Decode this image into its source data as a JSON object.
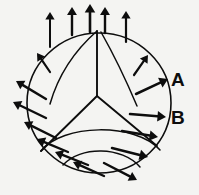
{
  "figure": {
    "background_color": "#f4f4f2",
    "ink_color": "#0d0d0d",
    "width": 199,
    "height": 195,
    "sphere": {
      "center_x": 99,
      "center_y": 103,
      "radius_x": 72,
      "radius_y": 70,
      "outline_stroke_width": 1.6
    },
    "junction": {
      "name": "y-junction",
      "center_x": 97,
      "center_y": 96,
      "branch_count": 3,
      "branch_endpoints": [
        {
          "x": 97,
          "y": 31
        },
        {
          "x": 41,
          "y": 151
        },
        {
          "x": 157,
          "y": 146
        }
      ]
    },
    "labels": [
      {
        "id": "A",
        "text": "A",
        "x": 171,
        "y": 70
      },
      {
        "id": "B",
        "text": "B",
        "x": 171,
        "y": 108
      }
    ],
    "domain_curves": [
      {
        "name": "left-meridian",
        "d": "M 97 31 C 73 52, 58 76, 50 104"
      },
      {
        "name": "right-meridian-upper",
        "d": "M 101 32 C 114 55, 126 80, 137 106"
      },
      {
        "name": "lower-lobe-large",
        "d": "M 41 151 C 62 124, 135 122, 160 150"
      },
      {
        "name": "lower-lobe-small",
        "d": "M 63 165 C 80 146, 122 146, 140 167"
      }
    ],
    "arrows": [
      {
        "id": "top-1",
        "x1": 50,
        "y1": 47,
        "x2": 50,
        "y2": 12,
        "head": 7.5,
        "width": 2.0
      },
      {
        "id": "top-2",
        "x1": 72,
        "y1": 35,
        "x2": 72,
        "y2": 7,
        "head": 8.0,
        "width": 2.4
      },
      {
        "id": "top-3",
        "x1": 90,
        "y1": 32,
        "x2": 90,
        "y2": 4,
        "head": 8.5,
        "width": 2.6
      },
      {
        "id": "top-4",
        "x1": 105,
        "y1": 33,
        "x2": 105,
        "y2": 7,
        "head": 8.0,
        "width": 2.4
      },
      {
        "id": "top-5",
        "x1": 126,
        "y1": 42,
        "x2": 126,
        "y2": 11,
        "head": 7.5,
        "width": 2.2
      },
      {
        "id": "upper-left-1",
        "x1": 50,
        "y1": 72,
        "x2": 37,
        "y2": 53,
        "head": 7.5,
        "width": 2.2
      },
      {
        "id": "left-1",
        "x1": 46,
        "y1": 99,
        "x2": 16,
        "y2": 81,
        "head": 8.0,
        "width": 2.4
      },
      {
        "id": "left-2",
        "x1": 46,
        "y1": 118,
        "x2": 13,
        "y2": 102,
        "head": 8.0,
        "width": 2.4
      },
      {
        "id": "left-3",
        "x1": 56,
        "y1": 138,
        "x2": 24,
        "y2": 122,
        "head": 8.0,
        "width": 2.4
      },
      {
        "id": "left-4",
        "x1": 68,
        "y1": 152,
        "x2": 37,
        "y2": 139,
        "head": 8.0,
        "width": 2.4
      },
      {
        "id": "bottom-left-1",
        "x1": 88,
        "y1": 165,
        "x2": 55,
        "y2": 152,
        "head": 8.0,
        "width": 2.4
      },
      {
        "id": "bottom-left-2",
        "x1": 104,
        "y1": 176,
        "x2": 73,
        "y2": 162,
        "head": 8.0,
        "width": 2.4
      },
      {
        "id": "upper-right-1",
        "x1": 134,
        "y1": 75,
        "x2": 148,
        "y2": 55,
        "head": 7.5,
        "width": 2.2
      },
      {
        "id": "right-a",
        "x1": 136,
        "y1": 94,
        "x2": 168,
        "y2": 79,
        "head": 8.5,
        "width": 2.5
      },
      {
        "id": "right-b",
        "x1": 130,
        "y1": 114,
        "x2": 166,
        "y2": 117,
        "head": 8.5,
        "width": 2.5
      },
      {
        "id": "right-1",
        "x1": 122,
        "y1": 131,
        "x2": 158,
        "y2": 137,
        "head": 8.5,
        "width": 2.5
      },
      {
        "id": "right-2",
        "x1": 112,
        "y1": 148,
        "x2": 148,
        "y2": 157,
        "head": 8.5,
        "width": 2.5
      },
      {
        "id": "right-3",
        "x1": 104,
        "y1": 163,
        "x2": 137,
        "y2": 180,
        "head": 8.0,
        "width": 2.4
      }
    ]
  }
}
